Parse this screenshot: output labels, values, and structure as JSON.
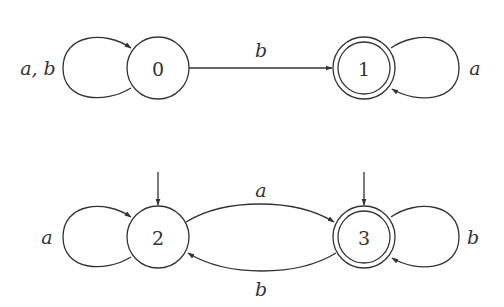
{
  "diagram": {
    "type": "finite-automata",
    "automata": [
      {
        "name": "automaton-top",
        "states": [
          {
            "id": "0",
            "label": "0",
            "initial": false,
            "accepting": false
          },
          {
            "id": "1",
            "label": "1",
            "initial": false,
            "accepting": true
          }
        ],
        "transitions": [
          {
            "from": "0",
            "to": "0",
            "label": "a, b"
          },
          {
            "from": "0",
            "to": "1",
            "label": "b"
          },
          {
            "from": "1",
            "to": "1",
            "label": "a"
          }
        ]
      },
      {
        "name": "automaton-bottom",
        "states": [
          {
            "id": "2",
            "label": "2",
            "initial": true,
            "accepting": false
          },
          {
            "id": "3",
            "label": "3",
            "initial": true,
            "accepting": true
          }
        ],
        "transitions": [
          {
            "from": "2",
            "to": "2",
            "label": "a"
          },
          {
            "from": "2",
            "to": "3",
            "label": "a"
          },
          {
            "from": "3",
            "to": "2",
            "label": "b"
          },
          {
            "from": "3",
            "to": "3",
            "label": "b"
          }
        ]
      }
    ]
  },
  "colors": {
    "stroke": "#333333",
    "background": "#ffffff"
  }
}
